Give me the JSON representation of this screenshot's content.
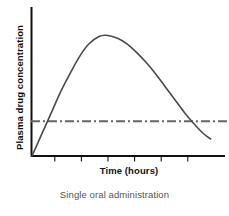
{
  "chart_data": {
    "type": "line",
    "title": "",
    "subtitle": "Single oral administration",
    "xlabel": "Time (hours)",
    "ylabel": "Plasma drug concentration",
    "xlim": [
      0,
      10
    ],
    "ylim": [
      0,
      10
    ],
    "grid": false,
    "legend": false,
    "axis_ticks": {
      "x_tick_positions": [
        1.2,
        2.6,
        4.0,
        5.4,
        6.8,
        8.2
      ],
      "x_tick_labels": [],
      "y_tick_labels": []
    },
    "series": [
      {
        "name": "Plasma drug concentration",
        "style": "solid",
        "color": "#4a4a4a",
        "x": [
          0.0,
          0.5,
          1.0,
          1.5,
          2.0,
          2.5,
          3.0,
          3.5,
          3.9,
          4.5,
          5.0,
          5.5,
          6.0,
          6.5,
          7.0,
          7.5,
          8.0,
          8.5,
          9.0,
          9.4
        ],
        "y": [
          0.0,
          1.5,
          3.0,
          4.5,
          5.8,
          7.0,
          7.9,
          8.4,
          8.5,
          8.3,
          7.9,
          7.3,
          6.6,
          5.8,
          4.9,
          4.0,
          3.1,
          2.3,
          1.6,
          1.2
        ]
      },
      {
        "name": "Minimum effective concentration",
        "style": "dash-dot",
        "color": "#666666",
        "x": [
          0.0,
          10.0
        ],
        "y": [
          2.45,
          2.45
        ]
      }
    ],
    "annotations": {
      "threshold_value": 2.45,
      "peak_x": 3.9,
      "peak_y": 8.5
    },
    "colors": {
      "background": "#ffffff",
      "axis": "#111111",
      "curve": "#4a4a4a",
      "threshold": "#666666",
      "label_text": "#111111",
      "caption_text": "#555555"
    }
  }
}
